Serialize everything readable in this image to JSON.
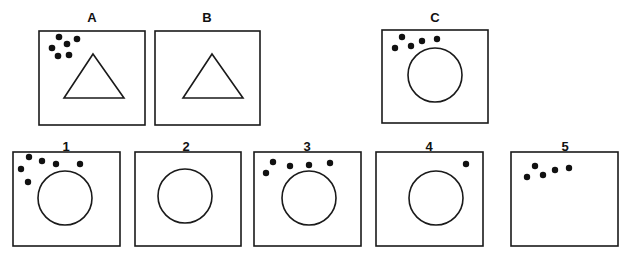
{
  "puzzle": {
    "type": "figural analogy (A is to B as C is to ?)",
    "color_stroke": "#1a1a1a",
    "color_dot": "#111111",
    "stimulus": [
      {
        "label": "A",
        "shape": "triangle",
        "dots": 6
      },
      {
        "label": "B",
        "shape": "triangle",
        "dots": 0
      },
      {
        "label": "C",
        "shape": "circle",
        "dots": 5
      }
    ],
    "options": [
      {
        "label": "1",
        "shape": "circle",
        "dots": 6
      },
      {
        "label": "2",
        "shape": "circle",
        "dots": 0
      },
      {
        "label": "3",
        "shape": "circle",
        "dots": 5
      },
      {
        "label": "4",
        "shape": "circle",
        "dots": 1
      },
      {
        "label": "5",
        "shape": "none",
        "dots": 5
      }
    ]
  }
}
